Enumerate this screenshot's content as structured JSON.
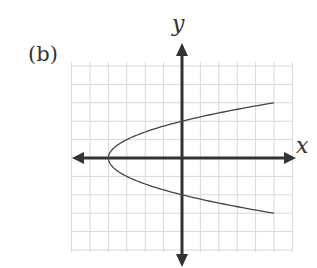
{
  "figure": {
    "panel_label": "(b)",
    "x_axis_label": "x",
    "y_axis_label": "y"
  },
  "colors": {
    "grid": "#d8d8d8",
    "axis": "#333333",
    "curve": "#444444",
    "text": "#333333"
  },
  "chart_data": {
    "type": "line",
    "title": "(b)",
    "xlabel": "x",
    "ylabel": "y",
    "xlim": [
      -6,
      6
    ],
    "ylim": [
      -5,
      5
    ],
    "grid": true,
    "tick_labels": false,
    "legend": null,
    "annotations": [],
    "series": [
      {
        "name": "x = y^2 - 4 (sideways parabola opening right)",
        "equation": "x = y^2 - 4",
        "vertex": [
          -4,
          0
        ],
        "y_intercepts": [
          2,
          -2
        ],
        "points": [
          [
            5,
            3
          ],
          [
            2.25,
            2.5
          ],
          [
            0,
            2
          ],
          [
            -1.75,
            1.5
          ],
          [
            -3,
            1
          ],
          [
            -3.75,
            0.5
          ],
          [
            -4,
            0
          ],
          [
            -3.75,
            -0.5
          ],
          [
            -3,
            -1
          ],
          [
            -1.75,
            -1.5
          ],
          [
            0,
            -2
          ],
          [
            2.25,
            -2.5
          ],
          [
            5,
            -3
          ]
        ]
      }
    ]
  }
}
